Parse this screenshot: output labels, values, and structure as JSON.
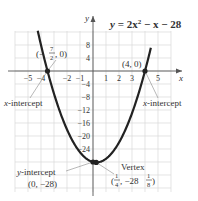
{
  "chart_data": {
    "type": "line",
    "equation": "y = 2x^2 - x - 28",
    "xlabel": "x",
    "ylabel": "y",
    "xlim": [
      -6,
      6
    ],
    "ylim": [
      -32,
      12
    ],
    "grid": true,
    "x_ticks": [
      -5,
      -4,
      -2,
      -1,
      1,
      2,
      3,
      5
    ],
    "x_tick_labels": [
      "−5",
      "−4",
      "−2",
      "−1",
      "1",
      "2",
      "3",
      "5"
    ],
    "y_ticks": [
      8,
      4,
      -4,
      -8,
      -12,
      -16,
      -20,
      -24
    ],
    "y_tick_labels": [
      "8",
      "4",
      "−4",
      "−8",
      "−12",
      "−16",
      "−20",
      "−24"
    ],
    "series": [
      {
        "name": "y = 2x^2 - x - 28",
        "x": [
          -4.5,
          -4,
          -3.5,
          -3,
          -2,
          -1,
          0,
          0.25,
          1,
          2,
          3,
          4,
          4.5
        ],
        "y": [
          17.5,
          8,
          0,
          -7,
          -18,
          -25,
          -28,
          -28.125,
          -27,
          -22,
          -13,
          0,
          7
        ]
      }
    ],
    "points": [
      {
        "name": "x-intercept-left",
        "x": -3.5,
        "y": 0
      },
      {
        "name": "x-intercept-right",
        "x": 4,
        "y": 0
      },
      {
        "name": "y-intercept",
        "x": 0,
        "y": -28
      },
      {
        "name": "vertex",
        "x": 0.25,
        "y": -28.125
      }
    ],
    "annotations": [
      {
        "text": "(−7/2, 0)",
        "target": "x-intercept-left"
      },
      {
        "text": "(4, 0)",
        "target": "x-intercept-right"
      },
      {
        "text": "x-intercept",
        "target": "x-intercept-left"
      },
      {
        "text": "x-intercept",
        "target": "x-intercept-right"
      },
      {
        "text": "y-intercept (0, −28)",
        "target": "y-intercept"
      },
      {
        "text": "Vertex (1/4, −28 1/8)",
        "target": "vertex"
      }
    ]
  },
  "labels": {
    "title_y": "y",
    "title_eq": " = 2x",
    "title_exp": "2",
    "title_rest": " − x − 28",
    "axis_x": "x",
    "axis_y": "y",
    "left_point_open": "(−",
    "left_point_num": "7",
    "left_point_den": "2",
    "left_point_close": ", 0)",
    "right_point": "(4, 0)",
    "x_intercept_left": "x-intercept",
    "x_intercept_right": "x-intercept",
    "y_intercept_label": "y-intercept",
    "y_intercept_coords": "(0, −28)",
    "vertex_label": "Vertex",
    "vertex_open": "(",
    "vertex_num": "1",
    "vertex_den": "4",
    "vertex_mid": ", −28",
    "vertex_fnum": "1",
    "vertex_fden": "8",
    "vertex_close": ")"
  },
  "colors": {
    "curve": "#222222",
    "grid": "#d9d9d9",
    "axis": "#555555",
    "text": "#333333"
  }
}
